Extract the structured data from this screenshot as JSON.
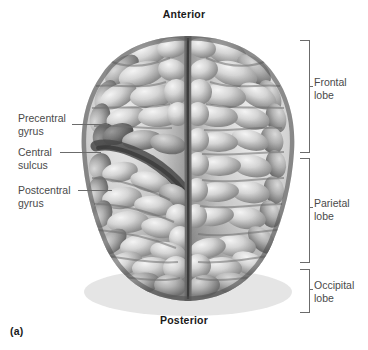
{
  "figure": {
    "panel_letter": "(a)",
    "view": "superior view of the cerebrum",
    "orientation": {
      "top_label": "Anterior",
      "bottom_label": "Posterior"
    }
  },
  "left_labels": [
    {
      "id": "precentral-gyrus",
      "line1": "Precentral",
      "line2": "gyrus"
    },
    {
      "id": "central-sulcus",
      "line1": "Central",
      "line2": "sulcus"
    },
    {
      "id": "postcentral-gyrus",
      "line1": "Postcentral",
      "line2": "gyrus"
    }
  ],
  "right_labels": [
    {
      "id": "frontal-lobe",
      "line1": "Frontal",
      "line2": "lobe"
    },
    {
      "id": "parietal-lobe",
      "line1": "Parietal",
      "line2": "lobe"
    },
    {
      "id": "occipital-lobe",
      "line1": "Occipital",
      "line2": "lobe"
    }
  ],
  "colors": {
    "background": "#ffffff",
    "label_text": "#4a4a4a",
    "bold_text": "#1a1a1a",
    "leader_line": "#6b6b6b",
    "brain_light": "#e6e6e6",
    "brain_mid": "#b4b4b4",
    "brain_shadow": "#5c5c5c",
    "sulcus_dark": "#4b4b4b",
    "highlight_band": "#8e8e8e"
  }
}
